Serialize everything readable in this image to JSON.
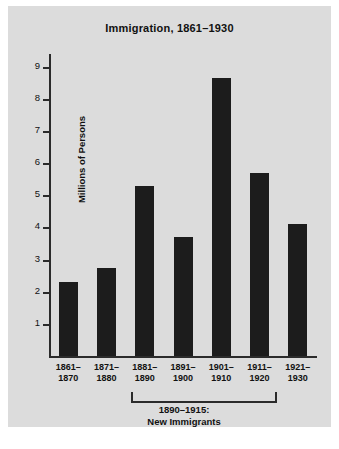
{
  "chart_data": {
    "type": "bar",
    "title": "Immigration, 1861–1930",
    "xlabel": "",
    "ylabel": "Millions of Persons",
    "categories": [
      "1861–1870",
      "1871–1880",
      "1881–1890",
      "1891–1900",
      "1901–1910",
      "1911–1920",
      "1921–1930"
    ],
    "category_lines": [
      [
        "1861–",
        "1870"
      ],
      [
        "1871–",
        "1880"
      ],
      [
        "1881–",
        "1890"
      ],
      [
        "1891–",
        "1900"
      ],
      [
        "1901–",
        "1910"
      ],
      [
        "1911–",
        "1920"
      ],
      [
        "1921–",
        "1930"
      ]
    ],
    "values": [
      2.3,
      2.75,
      5.3,
      3.7,
      8.65,
      5.7,
      4.1
    ],
    "ylim": [
      0,
      9.4
    ],
    "yticks": [
      1,
      2,
      3,
      4,
      5,
      6,
      7,
      8,
      9
    ],
    "ytick_labels": [
      "1",
      "2",
      "3",
      "4",
      "5",
      "6",
      "7",
      "8",
      "9"
    ],
    "grid": false,
    "legend": null,
    "bar_color": "#1c1c1c",
    "background_color": "#dcdcdc",
    "axis_color": "#2b2b2b"
  },
  "annotation": {
    "bracket_span_categories": [
      "1881–1890",
      "1891–1900",
      "1901–1910",
      "1911–1920"
    ],
    "label_line1": "1890–1915:",
    "label_line2": "New Immigrants"
  }
}
